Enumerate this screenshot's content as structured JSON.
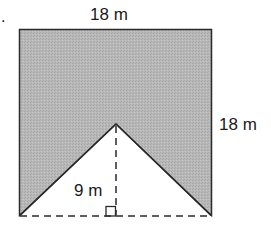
{
  "figure": {
    "bullet": ".",
    "top_label": "18 m",
    "right_label": "18 m",
    "height_label": "9 m",
    "fill_color": "#b4b4b4",
    "stroke_color": "#2a2a2a"
  }
}
